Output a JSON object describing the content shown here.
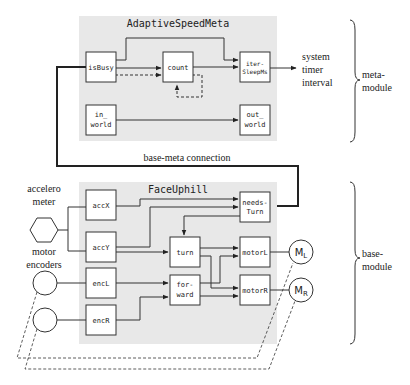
{
  "meta_module": {
    "title": "AdaptiveSpeedMeta",
    "blocks": {
      "isBusy": "isBusy",
      "count": "count",
      "iterSleep_l1": "iter-",
      "iterSleep_l2": "SleepMs",
      "inWorld_l1": "in_",
      "inWorld_l2": "world",
      "outWorld_l1": "out_",
      "outWorld_l2": "world"
    },
    "output_label": [
      "system",
      "timer",
      "interval"
    ],
    "brace_label": [
      "meta-",
      "module"
    ]
  },
  "connection_label": "base-meta connection",
  "base_module": {
    "title": "FaceUphill",
    "blocks": {
      "accX": "accX",
      "accY": "accY",
      "encL": "encL",
      "encR": "encR",
      "needsTurn_l1": "needs-",
      "needsTurn_l2": "Turn",
      "turn": "turn",
      "forward_l1": "for-",
      "forward_l2": "ward",
      "motorL": "motorL",
      "motorR": "motorR"
    },
    "brace_label": [
      "base-",
      "module"
    ]
  },
  "sensors": {
    "accelerometer": [
      "accelero",
      "meter"
    ],
    "motor_encoders": [
      "motor",
      "encoders"
    ]
  },
  "motors": {
    "left": {
      "base": "M",
      "sub": "L"
    },
    "right": {
      "base": "M",
      "sub": "R"
    }
  },
  "colors": {
    "module_bg": "#e8e8e8",
    "block_bg": "#ffffff",
    "line": "#333333"
  }
}
